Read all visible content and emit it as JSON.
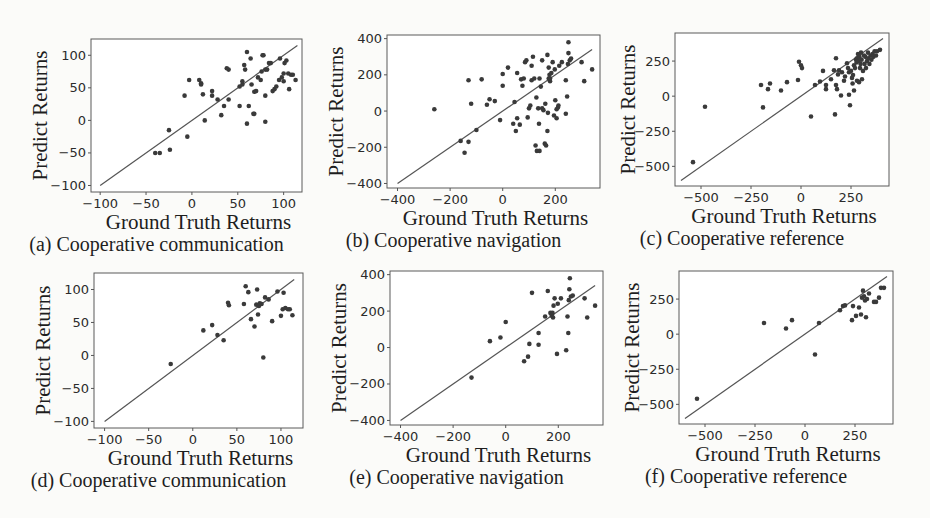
{
  "chart_data": [
    {
      "id": "a",
      "type": "scatter",
      "caption": "(a) Cooperative communication",
      "xlabel": "Ground Truth Returns",
      "ylabel": "Predict Returns",
      "xlim": [
        -110,
        120
      ],
      "ylim": [
        -110,
        125
      ],
      "xticks": [
        -100,
        -50,
        0,
        50,
        100
      ],
      "yticks": [
        -100,
        -50,
        0,
        50,
        100
      ],
      "xtick_labels": [
        "−100",
        "−50",
        "0",
        "50",
        "100"
      ],
      "ytick_labels": [
        "−100",
        "−50",
        "0",
        "50",
        "100"
      ],
      "diagonal": [
        -100,
        115
      ],
      "points": [
        [
          -40,
          -50
        ],
        [
          -35,
          -50
        ],
        [
          -25,
          -15
        ],
        [
          -24,
          -45
        ],
        [
          -5,
          -25
        ],
        [
          -8,
          38
        ],
        [
          -3,
          62
        ],
        [
          8,
          62
        ],
        [
          10,
          57
        ],
        [
          10,
          55
        ],
        [
          12,
          40
        ],
        [
          14,
          0
        ],
        [
          22,
          45
        ],
        [
          22,
          38
        ],
        [
          28,
          32
        ],
        [
          32,
          8
        ],
        [
          35,
          22
        ],
        [
          38,
          80
        ],
        [
          40,
          78
        ],
        [
          40,
          32
        ],
        [
          52,
          22
        ],
        [
          52,
          52
        ],
        [
          55,
          55
        ],
        [
          55,
          60
        ],
        [
          57,
          85
        ],
        [
          58,
          78
        ],
        [
          60,
          -5
        ],
        [
          60,
          105
        ],
        [
          62,
          22
        ],
        [
          64,
          95
        ],
        [
          65,
          55
        ],
        [
          67,
          10
        ],
        [
          68,
          10
        ],
        [
          68,
          44
        ],
        [
          70,
          45
        ],
        [
          72,
          66
        ],
        [
          75,
          62
        ],
        [
          76,
          75
        ],
        [
          77,
          100
        ],
        [
          78,
          100
        ],
        [
          80,
          -2
        ],
        [
          80,
          38
        ],
        [
          80,
          78
        ],
        [
          82,
          78
        ],
        [
          84,
          88
        ],
        [
          86,
          88
        ],
        [
          88,
          45
        ],
        [
          90,
          48
        ],
        [
          92,
          52
        ],
        [
          95,
          62
        ],
        [
          96,
          95
        ],
        [
          98,
          66
        ],
        [
          100,
          72
        ],
        [
          100,
          60
        ],
        [
          101,
          88
        ],
        [
          103,
          92
        ],
        [
          105,
          72
        ],
        [
          106,
          48
        ],
        [
          108,
          70
        ],
        [
          110,
          70
        ],
        [
          113,
          62
        ]
      ]
    },
    {
      "id": "b",
      "type": "scatter",
      "caption": "(b) Cooperative navigation",
      "xlabel": "Ground Truth Returns",
      "ylabel": "Predict Returns",
      "xlim": [
        -440,
        370
      ],
      "ylim": [
        -425,
        420
      ],
      "xticks": [
        -400,
        -200,
        0,
        200
      ],
      "yticks": [
        -400,
        -200,
        0,
        200,
        400
      ],
      "xtick_labels": [
        "−400",
        "−200",
        "0",
        "200"
      ],
      "ytick_labels": [
        "−400",
        "−200",
        "0",
        "200",
        "400"
      ],
      "diagonal": [
        -400,
        340
      ],
      "points": [
        [
          -260,
          10
        ],
        [
          -160,
          -165
        ],
        [
          -145,
          -230
        ],
        [
          -130,
          -170
        ],
        [
          -130,
          170
        ],
        [
          -120,
          40
        ],
        [
          -100,
          -105
        ],
        [
          -80,
          175
        ],
        [
          -60,
          35
        ],
        [
          -50,
          65
        ],
        [
          -30,
          55
        ],
        [
          -10,
          -50
        ],
        [
          0,
          140
        ],
        [
          0,
          205
        ],
        [
          20,
          240
        ],
        [
          40,
          -70
        ],
        [
          45,
          50
        ],
        [
          50,
          -110
        ],
        [
          55,
          -40
        ],
        [
          55,
          210
        ],
        [
          65,
          -75
        ],
        [
          70,
          175
        ],
        [
          75,
          140
        ],
        [
          80,
          180
        ],
        [
          85,
          270
        ],
        [
          90,
          280
        ],
        [
          95,
          -35
        ],
        [
          100,
          15
        ],
        [
          105,
          30
        ],
        [
          110,
          170
        ],
        [
          110,
          250
        ],
        [
          115,
          300
        ],
        [
          120,
          180
        ],
        [
          125,
          -190
        ],
        [
          128,
          75
        ],
        [
          130,
          -220
        ],
        [
          135,
          15
        ],
        [
          138,
          -70
        ],
        [
          140,
          180
        ],
        [
          140,
          -220
        ],
        [
          145,
          135
        ],
        [
          150,
          15
        ],
        [
          150,
          280
        ],
        [
          155,
          5
        ],
        [
          160,
          -180
        ],
        [
          162,
          40
        ],
        [
          165,
          -190
        ],
        [
          170,
          -110
        ],
        [
          170,
          310
        ],
        [
          172,
          -10
        ],
        [
          175,
          180
        ],
        [
          175,
          240
        ],
        [
          178,
          200
        ],
        [
          180,
          165
        ],
        [
          180,
          180
        ],
        [
          185,
          210
        ],
        [
          190,
          270
        ],
        [
          195,
          -25
        ],
        [
          198,
          230
        ],
        [
          200,
          60
        ],
        [
          205,
          10
        ],
        [
          205,
          -40
        ],
        [
          210,
          20
        ],
        [
          212,
          30
        ],
        [
          215,
          250
        ],
        [
          225,
          270
        ],
        [
          240,
          -15
        ],
        [
          240,
          170
        ],
        [
          245,
          80
        ],
        [
          248,
          260
        ],
        [
          250,
          320
        ],
        [
          250,
          380
        ],
        [
          255,
          280
        ],
        [
          260,
          290
        ],
        [
          300,
          270
        ],
        [
          310,
          165
        ],
        [
          340,
          230
        ]
      ]
    },
    {
      "id": "c",
      "type": "scatter",
      "caption": "(c) Cooperative reference",
      "xlabel": "Ground Truth Returns",
      "ylabel": "Predict Returns",
      "xlim": [
        -630,
        440
      ],
      "ylim": [
        -640,
        450
      ],
      "xticks": [
        -500,
        -250,
        0,
        250
      ],
      "yticks": [
        -500,
        -250,
        0,
        250
      ],
      "xtick_labels": [
        "−500",
        "−250",
        "0",
        "250"
      ],
      "ytick_labels": [
        "−500",
        "−250",
        "0",
        "250"
      ],
      "diagonal": [
        -600,
        410
      ],
      "points": [
        [
          -540,
          -470
        ],
        [
          -480,
          -75
        ],
        [
          -200,
          80
        ],
        [
          -190,
          -80
        ],
        [
          -165,
          50
        ],
        [
          -155,
          90
        ],
        [
          -100,
          40
        ],
        [
          -70,
          100
        ],
        [
          -15,
          115
        ],
        [
          -10,
          245
        ],
        [
          0,
          220
        ],
        [
          5,
          200
        ],
        [
          50,
          -145
        ],
        [
          70,
          80
        ],
        [
          95,
          105
        ],
        [
          110,
          180
        ],
        [
          125,
          80
        ],
        [
          125,
          50
        ],
        [
          150,
          120
        ],
        [
          165,
          185
        ],
        [
          170,
          -130
        ],
        [
          175,
          270
        ],
        [
          175,
          80
        ],
        [
          180,
          50
        ],
        [
          185,
          155
        ],
        [
          190,
          185
        ],
        [
          200,
          5
        ],
        [
          205,
          170
        ],
        [
          215,
          110
        ],
        [
          220,
          140
        ],
        [
          230,
          235
        ],
        [
          235,
          200
        ],
        [
          240,
          170
        ],
        [
          240,
          10
        ],
        [
          245,
          -65
        ],
        [
          250,
          180
        ],
        [
          255,
          130
        ],
        [
          258,
          90
        ],
        [
          260,
          150
        ],
        [
          265,
          40
        ],
        [
          265,
          220
        ],
        [
          270,
          200
        ],
        [
          275,
          260
        ],
        [
          278,
          240
        ],
        [
          280,
          110
        ],
        [
          280,
          270
        ],
        [
          285,
          300
        ],
        [
          288,
          250
        ],
        [
          290,
          100
        ],
        [
          292,
          280
        ],
        [
          295,
          200
        ],
        [
          298,
          230
        ],
        [
          300,
          310
        ],
        [
          303,
          260
        ],
        [
          305,
          120
        ],
        [
          310,
          180
        ],
        [
          315,
          290
        ],
        [
          318,
          230
        ],
        [
          322,
          280
        ],
        [
          325,
          200
        ],
        [
          330,
          250
        ],
        [
          335,
          310
        ],
        [
          338,
          270
        ],
        [
          342,
          230
        ],
        [
          348,
          290
        ],
        [
          352,
          260
        ],
        [
          358,
          300
        ],
        [
          362,
          280
        ],
        [
          368,
          320
        ],
        [
          375,
          290
        ],
        [
          380,
          320
        ],
        [
          395,
          330
        ]
      ]
    },
    {
      "id": "d",
      "type": "scatter",
      "caption": "(d) Cooperative communication",
      "xlabel": "Ground Truth Returns",
      "ylabel": "Predict Returns",
      "xlim": [
        -112,
        125
      ],
      "ylim": [
        -110,
        125
      ],
      "xticks": [
        -100,
        -50,
        0,
        50,
        100
      ],
      "yticks": [
        -100,
        -50,
        0,
        50,
        100
      ],
      "xtick_labels": [
        "−100",
        "−50",
        "0",
        "50",
        "100"
      ],
      "ytick_labels": [
        "−100",
        "−50",
        "0",
        "50",
        "100"
      ],
      "diagonal": [
        -100,
        115
      ],
      "points": [
        [
          -25,
          -13
        ],
        [
          12,
          38
        ],
        [
          22,
          46
        ],
        [
          28,
          31
        ],
        [
          35,
          23
        ],
        [
          40,
          80
        ],
        [
          41,
          76
        ],
        [
          58,
          78
        ],
        [
          60,
          105
        ],
        [
          63,
          96
        ],
        [
          66,
          55
        ],
        [
          70,
          44
        ],
        [
          72,
          77
        ],
        [
          73,
          100
        ],
        [
          74,
          62
        ],
        [
          75,
          75
        ],
        [
          76,
          79
        ],
        [
          78,
          78
        ],
        [
          80,
          -3
        ],
        [
          82,
          88
        ],
        [
          86,
          85
        ],
        [
          90,
          52
        ],
        [
          96,
          97
        ],
        [
          100,
          60
        ],
        [
          102,
          70
        ],
        [
          103,
          95
        ],
        [
          105,
          72
        ],
        [
          108,
          70
        ],
        [
          110,
          70
        ],
        [
          113,
          61
        ]
      ]
    },
    {
      "id": "e",
      "type": "scatter",
      "caption": "(e) Cooperative navigation",
      "xlabel": "Ground Truth Returns",
      "ylabel": "Predict Returns",
      "xlim": [
        -440,
        370
      ],
      "ylim": [
        -425,
        420
      ],
      "xticks": [
        -400,
        -200,
        0,
        200
      ],
      "yticks": [
        -400,
        -200,
        0,
        200,
        400
      ],
      "xtick_labels": [
        "−400",
        "−200",
        "0",
        "200"
      ],
      "ytick_labels": [
        "−400",
        "−200",
        "0",
        "200",
        "400"
      ],
      "diagonal": [
        -400,
        340
      ],
      "points": [
        [
          -130,
          -165
        ],
        [
          -60,
          35
        ],
        [
          -20,
          55
        ],
        [
          0,
          140
        ],
        [
          70,
          -75
        ],
        [
          85,
          -50
        ],
        [
          90,
          20
        ],
        [
          100,
          300
        ],
        [
          125,
          80
        ],
        [
          125,
          15
        ],
        [
          150,
          170
        ],
        [
          160,
          310
        ],
        [
          170,
          190
        ],
        [
          175,
          175
        ],
        [
          178,
          190
        ],
        [
          180,
          165
        ],
        [
          182,
          230
        ],
        [
          186,
          270
        ],
        [
          195,
          -35
        ],
        [
          198,
          240
        ],
        [
          210,
          270
        ],
        [
          230,
          -15
        ],
        [
          235,
          170
        ],
        [
          238,
          80
        ],
        [
          240,
          260
        ],
        [
          242,
          320
        ],
        [
          244,
          380
        ],
        [
          248,
          280
        ],
        [
          255,
          285
        ],
        [
          300,
          270
        ],
        [
          310,
          165
        ],
        [
          340,
          230
        ]
      ]
    },
    {
      "id": "f",
      "type": "scatter",
      "caption": "(f) Cooperative reference",
      "xlabel": "Ground Truth Returns",
      "ylabel": "Predict Returns",
      "xlim": [
        -630,
        440
      ],
      "ylim": [
        -640,
        450
      ],
      "xticks": [
        -500,
        -250,
        0,
        250
      ],
      "yticks": [
        -500,
        -250,
        0,
        250
      ],
      "xtick_labels": [
        "−500",
        "−250",
        "0",
        "250"
      ],
      "ytick_labels": [
        "−500",
        "−250",
        "0",
        "250"
      ],
      "diagonal": [
        -600,
        410
      ],
      "points": [
        [
          -540,
          -460
        ],
        [
          -205,
          80
        ],
        [
          -95,
          40
        ],
        [
          -65,
          100
        ],
        [
          50,
          -145
        ],
        [
          70,
          80
        ],
        [
          175,
          170
        ],
        [
          190,
          200
        ],
        [
          200,
          205
        ],
        [
          235,
          100
        ],
        [
          240,
          200
        ],
        [
          255,
          130
        ],
        [
          270,
          190
        ],
        [
          280,
          140
        ],
        [
          285,
          260
        ],
        [
          290,
          310
        ],
        [
          295,
          270
        ],
        [
          300,
          240
        ],
        [
          305,
          120
        ],
        [
          310,
          250
        ],
        [
          320,
          290
        ],
        [
          345,
          230
        ],
        [
          355,
          230
        ],
        [
          370,
          260
        ],
        [
          380,
          330
        ],
        [
          395,
          330
        ]
      ]
    }
  ]
}
